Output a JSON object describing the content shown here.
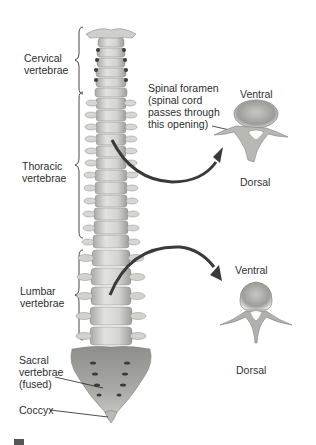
{
  "figure": {
    "regions": [
      {
        "id": "cervical",
        "label": "Cervical\nvertebrae"
      },
      {
        "id": "thoracic",
        "label": "Thoracic\nvertebrae"
      },
      {
        "id": "lumbar",
        "label": "Lumbar\nvertebrae"
      },
      {
        "id": "sacral",
        "label": "Sacral\nvertebrae\n(fused)"
      },
      {
        "id": "coccyx",
        "label": "Coccyx"
      }
    ],
    "callouts": {
      "spinal_foramen": "Spinal foramen\n(spinal cord\npasses through\nthis opening)"
    },
    "cross_sections": [
      {
        "id": "thoracic-section",
        "top_label": "Ventral",
        "bottom_label": "Dorsal"
      },
      {
        "id": "lumbar-section",
        "top_label": "Ventral",
        "bottom_label": "Dorsal"
      }
    ],
    "colors": {
      "bone": "#d9d9d6",
      "bone_shadow": "#a8a8a4",
      "sacrum": "#9e9e9a",
      "arrow": "#3a3a3a",
      "text": "#2e2e2e"
    }
  }
}
